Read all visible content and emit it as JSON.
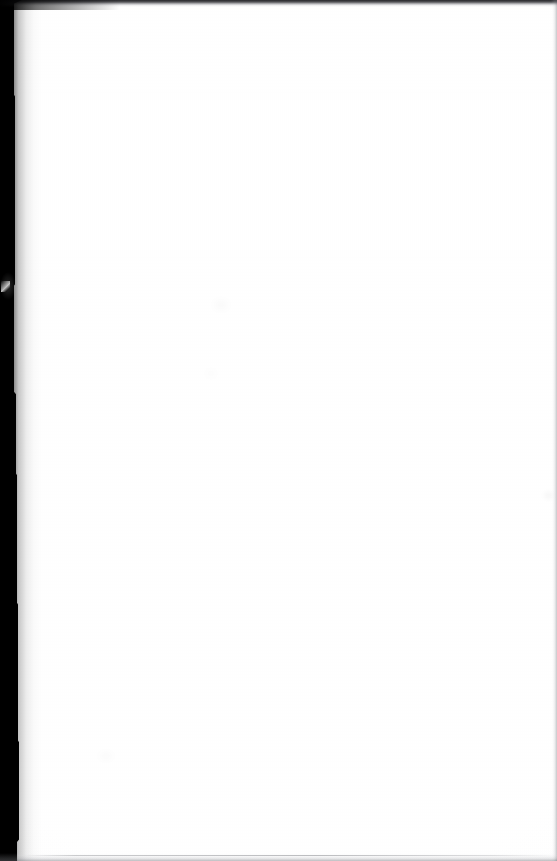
{
  "document": {
    "kind": "scanned-page",
    "content_state": "blank",
    "page_text": "",
    "caption": "Blank scanned page",
    "width_px": 557,
    "height_px": 861
  },
  "page": {
    "background_color": "#ffffff",
    "paper_tone_color": "#f8f8f9"
  },
  "artifacts": {
    "gutter": {
      "name": "left binding gutter shadow",
      "color": "#000000",
      "edge": "left",
      "approx_width_px": 18
    },
    "top_edge": {
      "name": "top scan edge line",
      "color": "#141418",
      "edge": "top",
      "approx_height_px": 3
    },
    "right_edge": {
      "name": "right page edge line",
      "color": "#787a80",
      "edge": "right",
      "approx_width_px": 2
    },
    "bottom_edge": {
      "name": "bottom page edge line",
      "color": "#6e7076",
      "edge": "bottom",
      "approx_height_px": 2
    },
    "gutter_highlight": {
      "name": "light scan artifact in gutter",
      "color": "#ffffff",
      "approx_x_px": 4,
      "approx_y_px": 285
    }
  }
}
